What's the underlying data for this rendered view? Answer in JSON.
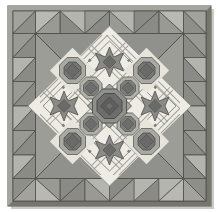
{
  "artwork": {
    "title": "Medallion Quilt",
    "kind": "quilt-pattern-photograph",
    "width_px": 219,
    "height_px": 212
  },
  "palette": {
    "background": "#ffffff",
    "cream": "#eceae2",
    "light_gray": "#d6d4cd",
    "mid_gray": "#a8a8a4",
    "medium_dark": "#8f8f8c",
    "dark_gray": "#6f6f6d",
    "darkest": "#4e4e4d",
    "outline": "#55554f",
    "frame_edge": "#7d7d78",
    "frame_shadow": "#909090",
    "binding": "#8b8b86"
  },
  "frame": {
    "name": "outer-binding",
    "x": 8,
    "y": 6,
    "width": 203,
    "height": 200,
    "binding_width": 5,
    "color": "#8b8b86",
    "edge_color": "#6b6b66"
  },
  "border": {
    "name": "sawtooth-triangle-border",
    "band_width": 27,
    "triangle_count_top": 6,
    "triangle_count_side": 6,
    "triangle_color": "#8d8d89",
    "corner_color": "#a6a6a1",
    "background": "#b5b5b0",
    "inner_line": "#5a5a55"
  },
  "inner_field": {
    "name": "on-point-medallion-field",
    "x": 40,
    "y": 35,
    "size": 140,
    "background": "#eeece4",
    "grid": "5x5 on-point diagonal lattice",
    "lattice_color": "#9a9a95",
    "lattice_light": "#dedcd4"
  },
  "blocks": [
    {
      "id": "center",
      "type": "octagon-medallion",
      "row": 2,
      "col": 2,
      "fill": "#6d6d6b",
      "ring": "#8f8f8c",
      "size": "large"
    },
    {
      "id": "diag-nw",
      "type": "octagon-block",
      "row": 1,
      "col": 1,
      "fill": "#7b7b78",
      "ring": "#a9a9a4",
      "size": "medium"
    },
    {
      "id": "diag-ne",
      "type": "octagon-block",
      "row": 1,
      "col": 3,
      "fill": "#7b7b78",
      "ring": "#a9a9a4",
      "size": "medium"
    },
    {
      "id": "diag-sw",
      "type": "octagon-block",
      "row": 3,
      "col": 1,
      "fill": "#7b7b78",
      "ring": "#a9a9a4",
      "size": "medium"
    },
    {
      "id": "diag-se",
      "type": "octagon-block",
      "row": 3,
      "col": 3,
      "fill": "#7b7b78",
      "ring": "#a9a9a4",
      "size": "medium"
    },
    {
      "id": "corner-nw",
      "type": "octagon-in-square",
      "row": 0,
      "col": 0,
      "fill": "#70706e",
      "ring": "#9d9d98",
      "size": "medium"
    },
    {
      "id": "corner-ne",
      "type": "octagon-in-square",
      "row": 0,
      "col": 4,
      "fill": "#70706e",
      "ring": "#9d9d98",
      "size": "medium"
    },
    {
      "id": "corner-sw",
      "type": "octagon-in-square",
      "row": 4,
      "col": 0,
      "fill": "#70706e",
      "ring": "#9d9d98",
      "size": "medium"
    },
    {
      "id": "corner-se",
      "type": "octagon-in-square",
      "row": 4,
      "col": 4,
      "fill": "#70706e",
      "ring": "#9d9d98",
      "size": "medium"
    },
    {
      "id": "star-n",
      "type": "sawtooth-star",
      "row": 0,
      "col": 2,
      "fill": "#83837f",
      "center": "#6a6a68",
      "size": "medium"
    },
    {
      "id": "star-s",
      "type": "sawtooth-star",
      "row": 4,
      "col": 2,
      "fill": "#83837f",
      "center": "#6a6a68",
      "size": "medium"
    },
    {
      "id": "star-w",
      "type": "sawtooth-star",
      "row": 2,
      "col": 0,
      "fill": "#83837f",
      "center": "#6a6a68",
      "size": "medium"
    },
    {
      "id": "star-e",
      "type": "sawtooth-star",
      "row": 2,
      "col": 4,
      "fill": "#83837f",
      "center": "#6a6a68",
      "size": "medium"
    }
  ],
  "counts": {
    "octagon_blocks": 9,
    "sawtooth_stars": 4,
    "border_triangles": 24
  }
}
